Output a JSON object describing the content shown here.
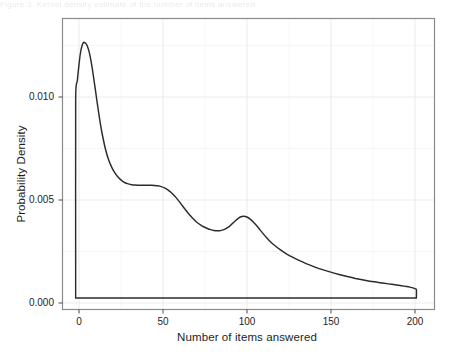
{
  "figure": {
    "top_caption_fragment": "Figure 3. Kernel density estimate of the number of items answered",
    "background_color": "#ffffff",
    "panel_border_color": "#7f7f7f",
    "grid_color": "#f0f0f0",
    "curve_color": "#2b2b2b",
    "text_color": "#1d1d1d"
  },
  "chart_data": {
    "type": "line",
    "title": "",
    "subtitle": "",
    "xlabel": "Number of items answered",
    "ylabel": "Probability Density",
    "xlim": [
      -8,
      218
    ],
    "ylim": [
      -0.0006,
      0.0146
    ],
    "xticks": [
      0,
      50,
      100,
      150,
      200
    ],
    "xticklabels": [
      "0",
      "50",
      "100",
      "150",
      "200"
    ],
    "yticks": [
      0.0,
      0.005,
      0.01
    ],
    "yticklabels": [
      "0.000",
      "0.005",
      "0.010"
    ],
    "grid": true,
    "grid_minor": true,
    "legend": null,
    "legend_position": "none",
    "annotations": [],
    "series": [
      {
        "name": "Probability density of number of items answered",
        "x": [
          0.0,
          0.0,
          1.0,
          2.0,
          3.0,
          4.0,
          5.0,
          6.0,
          6.5,
          7.0,
          8.0,
          9.0,
          10.0,
          11.0,
          12.0,
          13.0,
          14.0,
          15.0,
          16.0,
          18.0,
          20.0,
          22.0,
          24.0,
          26.0,
          28.0,
          30.0,
          32.0,
          34.0,
          36.0,
          38.0,
          40.0,
          42.0,
          44.0,
          46.0,
          48.0,
          50.0,
          52.0,
          54.0,
          56.0,
          58.0,
          60.0,
          62.0,
          64.0,
          66.0,
          68.0,
          70.0,
          72.0,
          74.0,
          76.0,
          78.0,
          80.0,
          82.0,
          84.0,
          86.0,
          88.0,
          90.0,
          92.0,
          94.0,
          96.0,
          98.0,
          100.0,
          102.0,
          104.0,
          106.0,
          108.0,
          110.0,
          112.0,
          114.0,
          116.0,
          118.0,
          120.0,
          124.0,
          128.0,
          132.0,
          136.0,
          140.0,
          145.0,
          150.0,
          155.0,
          160.0,
          165.0,
          170.0,
          175.0,
          180.0,
          185.0,
          190.0,
          194.0,
          198.0,
          201.0,
          203.0,
          205.0,
          206.0,
          207.0,
          207.0
        ],
        "y": [
          0.0,
          0.01045,
          0.01135,
          0.01218,
          0.01285,
          0.01322,
          0.01336,
          0.01331,
          0.01326,
          0.01318,
          0.01292,
          0.01253,
          0.01203,
          0.01146,
          0.01086,
          0.01025,
          0.00966,
          0.00911,
          0.00862,
          0.00781,
          0.00722,
          0.00681,
          0.00651,
          0.00629,
          0.00613,
          0.00602,
          0.00596,
          0.00592,
          0.0059,
          0.00589,
          0.00589,
          0.00589,
          0.00589,
          0.00589,
          0.00588,
          0.00586,
          0.00582,
          0.00575,
          0.00565,
          0.00551,
          0.00534,
          0.00514,
          0.00492,
          0.00469,
          0.00447,
          0.00427,
          0.00409,
          0.00393,
          0.00381,
          0.00371,
          0.00363,
          0.00357,
          0.00353,
          0.00351,
          0.00352,
          0.00357,
          0.00366,
          0.00379,
          0.00395,
          0.00411,
          0.00423,
          0.00427,
          0.00423,
          0.00412,
          0.00396,
          0.00377,
          0.00356,
          0.00335,
          0.00315,
          0.00297,
          0.00281,
          0.00254,
          0.00231,
          0.00212,
          0.00195,
          0.0018,
          0.00163,
          0.00148,
          0.00135,
          0.00123,
          0.00112,
          0.00102,
          0.00094,
          0.00086,
          0.0008,
          0.00074,
          0.00069,
          0.00064,
          0.0006,
          0.00057,
          0.00053,
          0.00049,
          0.00045,
          0.0
        ]
      }
    ],
    "baseline": {
      "name": "zero baseline",
      "x": [
        0,
        207
      ],
      "y": [
        0.0,
        0.0
      ]
    }
  }
}
